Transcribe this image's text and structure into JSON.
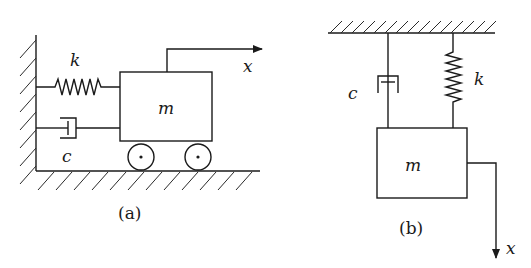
{
  "figure": {
    "panels": [
      {
        "id": "a",
        "caption": "(a)",
        "orientation": "horizontal",
        "labels": {
          "spring": "k",
          "damper": "c",
          "mass": "m",
          "displacement": "x"
        },
        "components": [
          "fixed-wall",
          "spring",
          "damper",
          "mass-on-wheels",
          "ground",
          "displacement-arrow-right"
        ]
      },
      {
        "id": "b",
        "caption": "(b)",
        "orientation": "vertical",
        "labels": {
          "spring": "k",
          "damper": "c",
          "mass": "m",
          "displacement": "x"
        },
        "components": [
          "fixed-ceiling",
          "damper",
          "spring",
          "hanging-mass",
          "displacement-arrow-down"
        ]
      }
    ],
    "colors": {
      "line": "#1a1a1a",
      "background": "#ffffff"
    }
  }
}
